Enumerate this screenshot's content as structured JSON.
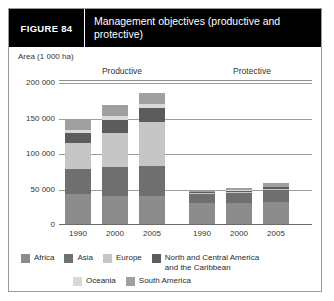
{
  "figure": {
    "label": "FIGURE  84",
    "title": "Management objectives (productive and protective)"
  },
  "chart_data": {
    "type": "bar",
    "subtype": "stacked-bar-grouped",
    "title": "Management objectives (productive and protective)",
    "ylabel": "Area (1 000 ha)",
    "xlabel": "",
    "ylim": [
      0,
      200000
    ],
    "yticks": [
      0,
      50000,
      100000,
      150000,
      200000
    ],
    "ytick_labels": [
      "0",
      "50 000",
      "100 000",
      "150 000",
      "200 000"
    ],
    "grid": true,
    "legend_position": "bottom",
    "groups": [
      "Productive",
      "Protective"
    ],
    "categories": [
      "1990",
      "2000",
      "2005",
      "1990",
      "2000",
      "2005"
    ],
    "series": [
      {
        "name": "Africa",
        "color": "#8c8c8c",
        "values": [
          42000,
          40000,
          39000,
          29000,
          30000,
          31000
        ]
      },
      {
        "name": "Asia",
        "color": "#6f6f6f",
        "values": [
          36000,
          41000,
          43000,
          13000,
          14000,
          17000
        ]
      },
      {
        "name": "Europe",
        "color": "#c6c6c6",
        "values": [
          36000,
          47000,
          62000,
          1500,
          1700,
          2000
        ]
      },
      {
        "name": "North and Central America and the Caribbean",
        "color": "#5c5c5c",
        "values": [
          14000,
          18000,
          19000,
          1200,
          1300,
          1500
        ]
      },
      {
        "name": "Oceania",
        "color": "#d9d9d9",
        "values": [
          5000,
          6000,
          6000,
          600,
          700,
          800
        ]
      },
      {
        "name": "South America",
        "color": "#a0a0a0",
        "values": [
          15000,
          15000,
          15000,
          2500,
          2700,
          5500
        ]
      }
    ],
    "totals": [
      148000,
      167000,
      184000,
      47800,
      50400,
      57800
    ]
  },
  "axis": {
    "title": "Area (1 000 ha)",
    "ticks": [
      "200 000",
      "150 000",
      "100 000",
      "50 000",
      "0"
    ]
  },
  "groups": {
    "productive": "Productive",
    "protective": "Protective"
  },
  "xlabels": [
    "1990",
    "2000",
    "2005",
    "1990",
    "2000",
    "2005"
  ],
  "legend": {
    "row1": [
      {
        "label": "Africa",
        "color": "#8c8c8c"
      },
      {
        "label": "Asia",
        "color": "#6f6f6f"
      },
      {
        "label": "Europe",
        "color": "#c6c6c6"
      },
      {
        "label": "North and Central America\nand the Caribbean",
        "color": "#5c5c5c"
      }
    ],
    "row2": [
      {
        "label": "Oceania",
        "color": "#d9d9d9"
      },
      {
        "label": "South America",
        "color": "#a0a0a0"
      }
    ]
  }
}
